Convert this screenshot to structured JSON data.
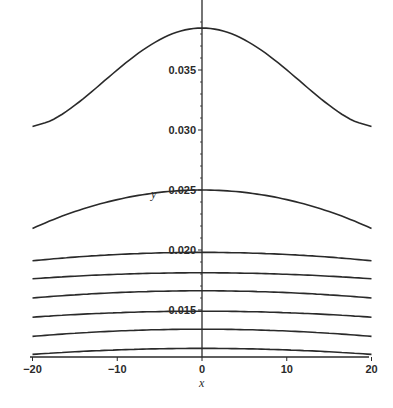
{
  "chart_data": {
    "type": "line",
    "title": "",
    "xlabel": "x",
    "ylabel": "y",
    "xlim": [
      -20,
      20
    ],
    "ylim": [
      0.0111,
      0.039
    ],
    "grid": false,
    "legend": null,
    "x_ticks": [
      -20,
      -10,
      0,
      10,
      20
    ],
    "x_tick_labels": [
      "-20",
      "-10",
      "0",
      "10",
      "20"
    ],
    "y_ticks": [
      0.015,
      0.02,
      0.025,
      0.03,
      0.035
    ],
    "y_tick_labels": [
      "0.015",
      "0.020",
      "0.025",
      "0.030",
      "0.035"
    ],
    "x": [
      -20,
      -18,
      -10,
      0,
      10,
      18,
      20
    ],
    "series": [
      {
        "name": "curve-1",
        "values": [
          0.0303,
          0.0307,
          0.0355,
          0.0385,
          0.0355,
          0.0307,
          0.0303
        ]
      },
      {
        "name": "curve-2",
        "values": [
          0.0218,
          0.0224,
          0.0241,
          0.025,
          0.0241,
          0.0224,
          0.0218
        ]
      },
      {
        "name": "curve-3",
        "values": [
          0.0191,
          0.0192,
          0.0196,
          0.0198,
          0.0196,
          0.0192,
          0.0191
        ]
      },
      {
        "name": "curve-4",
        "values": [
          0.0176,
          0.0177,
          0.018,
          0.0181,
          0.018,
          0.0177,
          0.0176
        ]
      },
      {
        "name": "curve-5",
        "values": [
          0.016,
          0.0161,
          0.0164,
          0.0166,
          0.0164,
          0.0161,
          0.016
        ]
      },
      {
        "name": "curve-6",
        "values": [
          0.0144,
          0.0145,
          0.0148,
          0.0149,
          0.0148,
          0.0145,
          0.0144
        ]
      },
      {
        "name": "curve-7",
        "values": [
          0.0128,
          0.0129,
          0.0132,
          0.0134,
          0.0132,
          0.0129,
          0.0128
        ]
      },
      {
        "name": "curve-8",
        "values": [
          0.0113,
          0.0114,
          0.0117,
          0.0118,
          0.0117,
          0.0114,
          0.0113
        ]
      }
    ]
  }
}
